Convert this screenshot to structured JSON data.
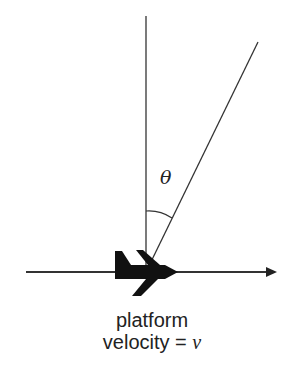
{
  "diagram": {
    "angle_label": "θ",
    "caption": {
      "line1": "platform",
      "line2_prefix": "velocity = ",
      "line2_variable": "v"
    },
    "elements": {
      "vertical_line": {
        "x": 146,
        "y1": 16,
        "y2": 272
      },
      "slant_line": {
        "x1": 258,
        "y1": 42,
        "x2": 146,
        "y2": 272
      },
      "velocity_arrow": {
        "x1": 26,
        "x2": 276,
        "y": 272
      },
      "platform_icon": "airplane",
      "angle_arc": "between vertical and slant line"
    },
    "colors": {
      "line": "#333333",
      "aircraft": "#111111",
      "text": "#222222",
      "background": "#ffffff"
    }
  }
}
